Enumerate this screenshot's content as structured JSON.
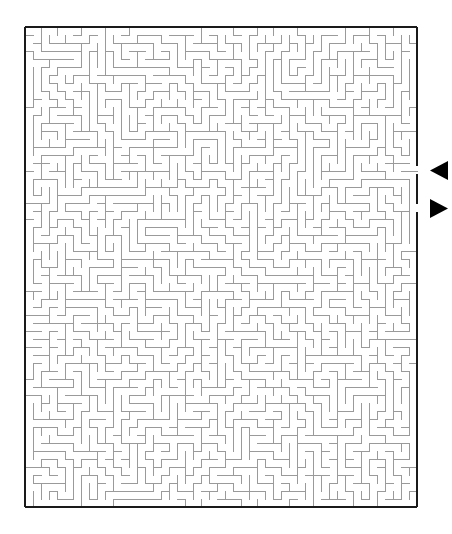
{
  "page": {
    "title": "Maze Puzzle",
    "background_color": "#ffffff",
    "width": 452,
    "height": 534
  },
  "maze": {
    "name": "rectangular-maze",
    "type": "perfect-maze",
    "columns": 49,
    "rows": 60,
    "cell_size": 8,
    "origin_x": 25,
    "origin_y": 27,
    "width": 392,
    "height": 478,
    "border_color": "#1a1a1a",
    "border_width": 2.5,
    "wall_color": "#9a9a9a",
    "wall_width": 1,
    "passage_color": "#ffffff"
  },
  "markers": {
    "entrance": {
      "label": "entrance-arrow",
      "direction": "left",
      "glyph": "◀",
      "color": "#000000",
      "x": 430,
      "y": 161,
      "width": 18,
      "height": 19,
      "border_gap_y": 170
    },
    "exit": {
      "label": "exit-arrow",
      "direction": "right",
      "glyph": "▶",
      "color": "#000000",
      "x": 430,
      "y": 199,
      "width": 18,
      "height": 19,
      "border_gap_y": 208
    }
  },
  "chart_data": {
    "type": "table",
    "title": "Maze Puzzle",
    "grid_columns": 49,
    "grid_rows": 60,
    "entrance_side": "right",
    "exit_side": "right"
  }
}
